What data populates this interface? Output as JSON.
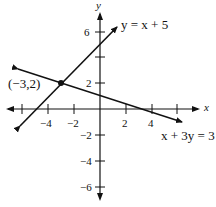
{
  "diagram": {
    "axes": {
      "x_label": "x",
      "y_label": "y"
    },
    "x_ticks": [
      {
        "value": -6,
        "label": ""
      },
      {
        "value": -4,
        "label": "−4"
      },
      {
        "value": -2,
        "label": "−2"
      },
      {
        "value": 2,
        "label": "2"
      },
      {
        "value": 4,
        "label": "4"
      },
      {
        "value": 6,
        "label": ""
      }
    ],
    "y_ticks": [
      {
        "value": 6,
        "label": "6"
      },
      {
        "value": 4,
        "label": ""
      },
      {
        "value": 2,
        "label": "2"
      },
      {
        "value": -2,
        "label": "−2"
      },
      {
        "value": -4,
        "label": "−4"
      },
      {
        "value": -6,
        "label": "−6"
      }
    ],
    "lines": [
      {
        "equation": "y = x + 5",
        "color": "#111111"
      },
      {
        "equation": "x + 3y = 3",
        "color": "#111111"
      }
    ],
    "intersection": {
      "label": "(−3,2)",
      "x": -3,
      "y": 2
    }
  }
}
